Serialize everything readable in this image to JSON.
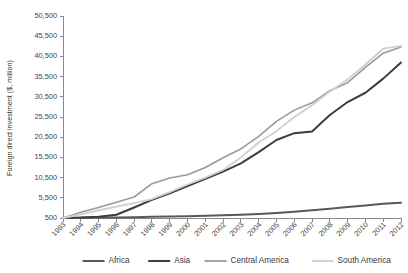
{
  "chart_data": {
    "type": "line",
    "title": "",
    "subtitle": "",
    "xlabel": "",
    "ylabel": "Foreign direct investment ($, million)",
    "grid": false,
    "legend_position": "bottom",
    "xlim": [
      1993,
      2012
    ],
    "ylim": [
      500,
      50500
    ],
    "ytick_labels": [
      "500",
      "5,500",
      "10,500",
      "15,500",
      "20,500",
      "25,500",
      "30,500",
      "35,500",
      "40,500",
      "45,500",
      "50,500"
    ],
    "ytick_values": [
      500,
      5500,
      10500,
      15500,
      20500,
      25500,
      30500,
      35500,
      40500,
      45500,
      50500
    ],
    "categories": [
      "1993",
      "1994",
      "1995",
      "1996",
      "1997",
      "1998",
      "1999",
      "2000",
      "2001",
      "2002",
      "2003",
      "2004",
      "2005",
      "2006",
      "2007",
      "2008",
      "2009",
      "2010",
      "2011",
      "2012"
    ],
    "x": [
      1993,
      1994,
      1995,
      1996,
      1997,
      1998,
      1999,
      2000,
      2001,
      2002,
      2003,
      2004,
      2005,
      2006,
      2007,
      2008,
      2009,
      2010,
      2011,
      2012
    ],
    "series": [
      {
        "name": "Africa",
        "color": "#595959",
        "width": 2.0,
        "values": [
          500,
          550,
          600,
          650,
          700,
          780,
          860,
          950,
          1050,
          1150,
          1300,
          1500,
          1750,
          2050,
          2400,
          2800,
          3200,
          3600,
          4000,
          4300
        ]
      },
      {
        "name": "Asia",
        "color": "#3d3d3d",
        "width": 2.0,
        "values": [
          500,
          600,
          800,
          1300,
          3100,
          5000,
          6600,
          8400,
          10200,
          12000,
          14000,
          16800,
          19800,
          21500,
          21900,
          26000,
          29200,
          31500,
          35000,
          39000
        ]
      },
      {
        "name": "Central America",
        "color": "#9a9a9a",
        "width": 1.6,
        "values": [
          500,
          1900,
          3100,
          4400,
          5700,
          9000,
          10400,
          11200,
          13000,
          15400,
          17600,
          20700,
          24400,
          27200,
          29000,
          32000,
          34000,
          37800,
          41300,
          42800
        ]
      },
      {
        "name": "South America",
        "color": "#cfcfcf",
        "width": 1.8,
        "values": [
          500,
          1400,
          2400,
          3300,
          4200,
          5200,
          6900,
          8800,
          10500,
          12400,
          15500,
          19200,
          22000,
          25500,
          28400,
          31800,
          34800,
          38500,
          42400,
          43100
        ]
      }
    ]
  },
  "legend": {
    "items": [
      {
        "label": "Africa"
      },
      {
        "label": "Asia"
      },
      {
        "label": "Central America"
      },
      {
        "label": "South America"
      }
    ]
  }
}
